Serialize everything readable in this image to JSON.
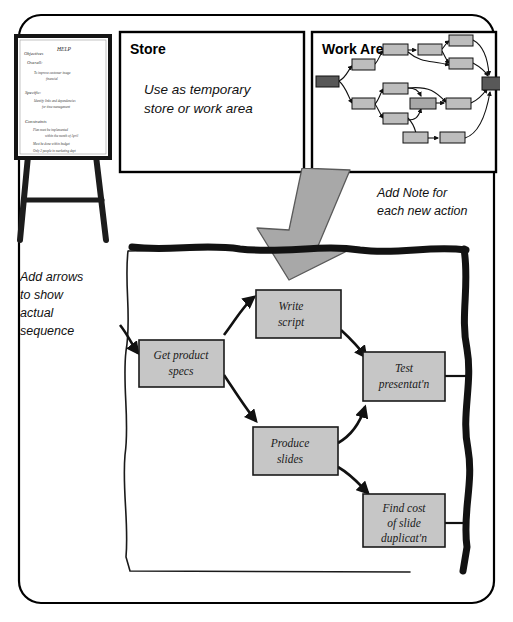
{
  "frame": {
    "name": "slide-frame",
    "border_color": "#000000",
    "background": "#ffffff"
  },
  "flipchart": {
    "title": "HELP",
    "sections": [
      {
        "heading": "Objectives",
        "subheading": "Overall:",
        "bullets": [
          "To improve customer image",
          "financial"
        ]
      },
      {
        "heading": "Specific:",
        "bullets": [
          "Identify links and dependencies",
          "for time management"
        ]
      },
      {
        "heading": "Constraints",
        "bullets": [
          "Plan must be implemented",
          "within the month of April",
          "Must be done within budget",
          "Only 2 people in marketing dept",
          "are available to implement it"
        ]
      }
    ],
    "easel_color": "#1c1c1c",
    "paper_color": "#ffffff"
  },
  "store_panel": {
    "title": "Store",
    "body_line1": "Use as temporary",
    "body_line2": "store or work area"
  },
  "work_area_panel": {
    "title": "Work Area",
    "node_fill": "#bdbdbd",
    "terminal_fill": "#585858",
    "nodes": [
      {
        "id": "start",
        "x": 6,
        "y": 46,
        "w": 23,
        "h": 11,
        "kind": "terminal"
      },
      {
        "id": "n1",
        "x": 42,
        "y": 29,
        "w": 23,
        "h": 11,
        "kind": "node"
      },
      {
        "id": "n2",
        "x": 73,
        "y": 14,
        "w": 25,
        "h": 11,
        "kind": "node"
      },
      {
        "id": "n3",
        "x": 108,
        "y": 14,
        "w": 24,
        "h": 11,
        "kind": "node"
      },
      {
        "id": "n4",
        "x": 139,
        "y": 5,
        "w": 24,
        "h": 11,
        "kind": "node"
      },
      {
        "id": "n5",
        "x": 139,
        "y": 28,
        "w": 24,
        "h": 11,
        "kind": "node"
      },
      {
        "id": "n6",
        "x": 42,
        "y": 68,
        "w": 23,
        "h": 11,
        "kind": "node"
      },
      {
        "id": "n7",
        "x": 73,
        "y": 53,
        "w": 25,
        "h": 11,
        "kind": "node"
      },
      {
        "id": "n8",
        "x": 73,
        "y": 83,
        "w": 25,
        "h": 11,
        "kind": "node"
      },
      {
        "id": "n9",
        "x": 100,
        "y": 68,
        "w": 26,
        "h": 11,
        "kind": "node"
      },
      {
        "id": "n10",
        "x": 136,
        "y": 68,
        "w": 25,
        "h": 11,
        "kind": "node"
      },
      {
        "id": "n11",
        "x": 93,
        "y": 102,
        "w": 25,
        "h": 11,
        "kind": "node"
      },
      {
        "id": "n12",
        "x": 130,
        "y": 102,
        "w": 25,
        "h": 11,
        "kind": "node"
      },
      {
        "id": "end",
        "x": 172,
        "y": 47,
        "w": 22,
        "h": 13,
        "kind": "terminal"
      }
    ]
  },
  "big_arrow": {
    "name": "drag-arrow",
    "fill": "#a8a8a8",
    "stroke": "#555555",
    "direction": "down-left"
  },
  "annotations": {
    "note_hint": {
      "line1": "Add Note for",
      "line2": "each new action"
    },
    "arrow_hint": {
      "line1": "Add arrows",
      "line2": "to show",
      "line3": "actual",
      "line4": "sequence"
    }
  },
  "flowchart": {
    "name": "sequence-flowchart",
    "node_fill": "#c6c6c6",
    "node_stroke": "#1a1a1a",
    "border_style": "hand-drawn",
    "right_border_color": "#111111",
    "nodes": [
      {
        "id": "get_product_specs",
        "label_line1": "Get product",
        "label_line2": "specs",
        "label_line3": "",
        "x": 139,
        "y": 340,
        "w": 85,
        "h": 47
      },
      {
        "id": "write_script",
        "label_line1": "Write",
        "label_line2": "script",
        "label_line3": "",
        "x": 256,
        "y": 290,
        "w": 85,
        "h": 48
      },
      {
        "id": "produce_slides",
        "label_line1": "Produce",
        "label_line2": "slides",
        "label_line3": "",
        "x": 251,
        "y": 427,
        "w": 85,
        "h": 48
      },
      {
        "id": "test_presentation",
        "label_line1": "Test",
        "label_line2": "presentat'n",
        "label_line3": "",
        "x": 363,
        "y": 352,
        "w": 82,
        "h": 49
      },
      {
        "id": "find_cost",
        "label_line1": "Find cost",
        "label_line2": "of slide",
        "label_line3": "duplicat'n",
        "x": 363,
        "y": 494,
        "w": 82,
        "h": 53
      }
    ],
    "edges": [
      {
        "from": "border",
        "to": "get_product_specs"
      },
      {
        "from": "get_product_specs",
        "to": "write_script"
      },
      {
        "from": "get_product_specs",
        "to": "produce_slides"
      },
      {
        "from": "write_script",
        "to": "test_presentation"
      },
      {
        "from": "produce_slides",
        "to": "test_presentation"
      },
      {
        "from": "produce_slides",
        "to": "find_cost"
      },
      {
        "from": "test_presentation",
        "to": "border"
      },
      {
        "from": "find_cost",
        "to": "border"
      }
    ]
  }
}
